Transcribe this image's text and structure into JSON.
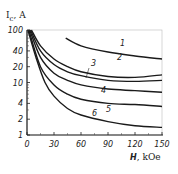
{
  "chart_data": {
    "type": "line",
    "title": "",
    "xlabel": "H, kOe",
    "ylabel": "I_c, A",
    "xlim": [
      0,
      150
    ],
    "ylim": [
      1,
      100
    ],
    "yscale": "log",
    "grid": false,
    "x_ticks": [
      "0",
      "30",
      "60",
      "90",
      "120",
      "150"
    ],
    "y_ticks": [
      "1",
      "2",
      "4",
      "10",
      "20",
      "40",
      "100"
    ],
    "series": [
      {
        "name": "1",
        "x": [
          43,
          60,
          90,
          120,
          150
        ],
        "values": [
          70,
          50,
          38,
          32,
          28
        ]
      },
      {
        "name": "2",
        "x": [
          5,
          15,
          30,
          45,
          60,
          90,
          120,
          150
        ],
        "values": [
          100,
          50,
          28,
          20,
          16,
          13,
          12.5,
          14
        ]
      },
      {
        "name": "3",
        "x": [
          4,
          15,
          30,
          45,
          60,
          90,
          120,
          150
        ],
        "values": [
          100,
          40,
          22,
          16,
          13.5,
          11,
          10.5,
          11
        ]
      },
      {
        "name": "4",
        "x": [
          3,
          15,
          30,
          45,
          60,
          90,
          120,
          150
        ],
        "values": [
          100,
          30,
          15,
          11,
          9,
          7.5,
          7,
          6.5
        ]
      },
      {
        "name": "5",
        "x": [
          2,
          15,
          30,
          45,
          60,
          90,
          120,
          150
        ],
        "values": [
          100,
          20,
          9,
          6,
          4.8,
          4,
          3.8,
          3.5
        ]
      },
      {
        "name": "6",
        "x": [
          1,
          10,
          20,
          30,
          45,
          60,
          90,
          120,
          150
        ],
        "values": [
          100,
          30,
          10,
          5.5,
          3.2,
          2.4,
          1.8,
          1.5,
          1.4
        ]
      }
    ]
  },
  "axes": {
    "ylabel_main": "I",
    "ylabel_sub": "c",
    "ylabel_unit": ", A",
    "xlabel_var": "H",
    "xlabel_unit": ", kOe"
  }
}
